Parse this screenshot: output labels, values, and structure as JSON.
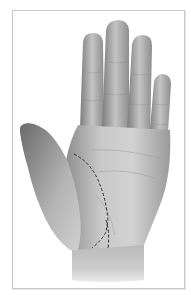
{
  "figure": {
    "colors": {
      "background": "#ffffff",
      "frame": "#c9c9c9",
      "skin_light": "#d4d4d4",
      "skin_mid": "#a9a9a9",
      "skin_dark": "#6e6e6e",
      "dashed_line": "#2a2a2a"
    }
  }
}
